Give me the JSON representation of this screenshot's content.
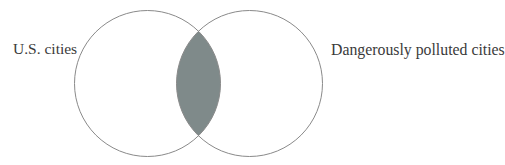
{
  "diagram": {
    "type": "venn",
    "sets": [
      {
        "id": "left",
        "label": "U.S. cities",
        "cx": 147.5,
        "cy": 83.5,
        "r": 73
      },
      {
        "id": "right",
        "label": "Dangerously polluted cities",
        "cx": 249.5,
        "cy": 83.5,
        "r": 73
      }
    ],
    "intersection": {
      "shaded": true,
      "fill": "#7f8a8a"
    },
    "colors": {
      "stroke": "#8a8a8a",
      "background": "#ffffff",
      "text": "#3a3a3a"
    }
  },
  "labels": {
    "left": "U.S. cities",
    "right": "Dangerously polluted cities"
  }
}
